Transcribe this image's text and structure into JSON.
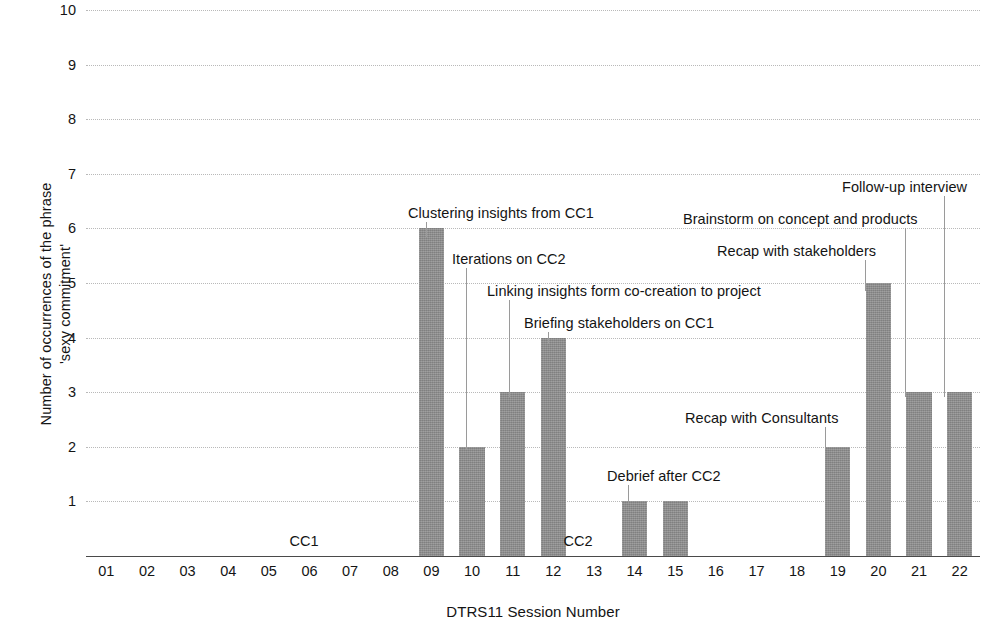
{
  "chart_data": {
    "type": "bar",
    "title": "",
    "xlabel": "DTRS11 Session Number",
    "ylabel": "Number of occurrences of the phrase 'sexy commitment'",
    "ylabel_lines": [
      "Number of occurrences of the phrase",
      "'sexy commitment'"
    ],
    "categories": [
      "01",
      "02",
      "03",
      "04",
      "05",
      "06",
      "07",
      "08",
      "09",
      "10",
      "11",
      "12",
      "13",
      "14",
      "15",
      "16",
      "17",
      "18",
      "19",
      "20",
      "21",
      "22"
    ],
    "values": [
      0,
      0,
      0,
      0,
      0,
      0,
      0,
      0,
      6,
      2,
      3,
      4,
      0,
      1,
      1,
      0,
      0,
      0,
      2,
      5,
      3,
      3
    ],
    "ylim": [
      0,
      10
    ],
    "yticks": [
      1,
      2,
      3,
      4,
      5,
      6,
      7,
      8,
      9,
      10
    ],
    "ytick_labels": [
      "1",
      "2",
      "3",
      "4",
      "5",
      "6",
      "7",
      "8",
      "9",
      "10"
    ],
    "grid": true,
    "grid_style": "dotted",
    "legend": "none",
    "bar_color": "#8c8c8c",
    "background_color": "#ffffff",
    "annotations": [
      {
        "id": "clustering-insights",
        "text": "Clustering insights from CC1",
        "session": "09",
        "value": 6,
        "label_x": 408,
        "label_y": 205,
        "leader_x": 426,
        "leader_top": 222,
        "leader_bottom": 237
      },
      {
        "id": "iterations-cc2",
        "text": "Iterations on CC2",
        "session": "10",
        "value": 2,
        "label_x": 452,
        "label_y": 251,
        "leader_x": 466,
        "leader_top": 268,
        "leader_bottom": 450
      },
      {
        "id": "linking-insights",
        "text": "Linking insights form co-creation to project",
        "session": "11",
        "value": 3,
        "label_x": 487,
        "label_y": 283,
        "leader_x": 509,
        "leader_top": 300,
        "leader_bottom": 397
      },
      {
        "id": "briefing-stakeholders",
        "text": "Briefing stakeholders on CC1",
        "session": "12",
        "value": 4,
        "label_x": 524,
        "label_y": 315,
        "leader_x": 548,
        "leader_top": 332,
        "leader_bottom": 344
      },
      {
        "id": "debrief-after-cc2",
        "text": "Debrief after CC2",
        "session": "14",
        "value": 1,
        "label_x": 607,
        "label_y": 468,
        "leader_x": 628,
        "leader_top": 485,
        "leader_bottom": 503
      },
      {
        "id": "recap-consultants",
        "text": "Recap with Consultants",
        "session": "19",
        "value": 2,
        "label_x": 685,
        "label_y": 410,
        "leader_x": 825,
        "leader_top": 427,
        "leader_bottom": 450
      },
      {
        "id": "recap-stakeholders",
        "text": "Recap with stakeholders",
        "session": "20",
        "value": 5,
        "label_x": 717,
        "label_y": 243,
        "leader_x": 865,
        "leader_top": 260,
        "leader_bottom": 291
      },
      {
        "id": "brainstorm-concept",
        "text": "Brainstorm on concept and products",
        "session": "21",
        "value": 3,
        "label_x": 683,
        "label_y": 211,
        "leader_x": 905,
        "leader_top": 228,
        "leader_bottom": 397
      },
      {
        "id": "follow-up-interview",
        "text": "Follow-up interview",
        "session": "22",
        "value": 3,
        "label_x": 842,
        "label_y": 179,
        "leader_x": 944,
        "leader_top": 196,
        "leader_bottom": 397
      }
    ],
    "phase_markers": [
      {
        "id": "cc1",
        "text": "CC1",
        "x": 304,
        "y": 533
      },
      {
        "id": "cc2",
        "text": "CC2",
        "x": 578,
        "y": 533
      }
    ]
  }
}
